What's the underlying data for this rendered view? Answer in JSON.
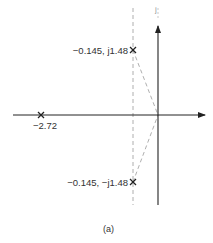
{
  "figure": {
    "caption": "(a)",
    "axes": {
      "imag_axis_label": "j",
      "real_axis_label": ""
    },
    "poles": [
      {
        "id": "upper",
        "label": "−0.145, j1.48",
        "real": -0.145,
        "imag": 1.48,
        "marker": "x"
      },
      {
        "id": "lower",
        "label": "−0.145, −j1.48",
        "real": -0.145,
        "imag": -1.48,
        "marker": "x"
      },
      {
        "id": "real",
        "label": "−2.72",
        "real": -2.72,
        "imag": 0,
        "marker": "x"
      }
    ],
    "colors": {
      "axis": "#222222",
      "dashed": "#9a9a9a",
      "marker": "#222222"
    }
  }
}
